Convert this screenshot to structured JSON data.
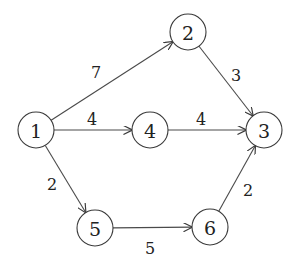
{
  "graph": {
    "type": "directed-weighted",
    "nodes": [
      {
        "id": "1",
        "label": "1",
        "x": 36,
        "y": 130
      },
      {
        "id": "2",
        "label": "2",
        "x": 188,
        "y": 32
      },
      {
        "id": "3",
        "label": "3",
        "x": 264,
        "y": 130
      },
      {
        "id": "4",
        "label": "4",
        "x": 150,
        "y": 130
      },
      {
        "id": "5",
        "label": "5",
        "x": 95,
        "y": 228
      },
      {
        "id": "6",
        "label": "6",
        "x": 210,
        "y": 227
      }
    ],
    "edges": [
      {
        "from": "1",
        "to": "2",
        "weight": "7",
        "lx": 96,
        "ly": 72
      },
      {
        "from": "2",
        "to": "3",
        "weight": "3",
        "lx": 236,
        "ly": 75
      },
      {
        "from": "1",
        "to": "4",
        "weight": "4",
        "lx": 92,
        "ly": 119
      },
      {
        "from": "4",
        "to": "3",
        "weight": "4",
        "lx": 201,
        "ly": 119
      },
      {
        "from": "1",
        "to": "5",
        "weight": "2",
        "lx": 52,
        "ly": 184
      },
      {
        "from": "5",
        "to": "6",
        "weight": "5",
        "lx": 150,
        "ly": 248
      },
      {
        "from": "6",
        "to": "3",
        "weight": "2",
        "lx": 248,
        "ly": 190
      }
    ],
    "node_radius": 18,
    "colors": {
      "stroke": "#3a3a3a",
      "text": "#222222",
      "background": "#ffffff"
    }
  }
}
